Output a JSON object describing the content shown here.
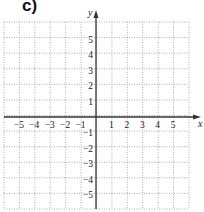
{
  "part_label": "c)",
  "graph": {
    "x_axis_label": "x",
    "y_axis_label": "y",
    "x_min": -6,
    "x_max": 6,
    "y_min": -6,
    "y_max": 6,
    "x_ticks": [
      "−5",
      "−4",
      "−3",
      "−2",
      "−1",
      "1",
      "2",
      "3",
      "4",
      "5"
    ],
    "x_tick_values": [
      -5,
      -4,
      -3,
      -2,
      -1,
      1,
      2,
      3,
      4,
      5
    ],
    "y_ticks": [
      "5",
      "4",
      "3",
      "2",
      "1",
      "−1",
      "−2",
      "−3",
      "−4",
      "−5"
    ],
    "y_tick_values": [
      5,
      4,
      3,
      2,
      1,
      -1,
      -2,
      -3,
      -4,
      -5
    ],
    "grid_style": "dotted",
    "grid_color": "#9a9a9a",
    "axis_color": "#333333"
  }
}
